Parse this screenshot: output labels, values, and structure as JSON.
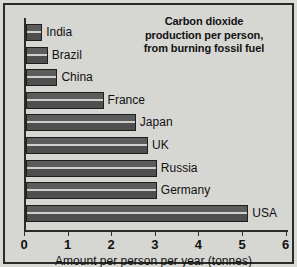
{
  "chart_data": {
    "type": "bar",
    "orientation": "horizontal",
    "title": "Carbon dioxide production per person, from burning fossil fuel",
    "title_lines": [
      "Carbon dioxide",
      "production per person,",
      "from burning fossil fuel"
    ],
    "xlabel": "Amount per person per year (tonnes)",
    "ylabel": "",
    "xlim": [
      0,
      6
    ],
    "xticks": [
      0,
      1,
      2,
      3,
      4,
      5,
      6
    ],
    "xtick_labels": [
      "0",
      "1",
      "2",
      "3",
      "4",
      "5",
      "6"
    ],
    "grid": false,
    "legend": false,
    "categories": [
      "India",
      "Brazil",
      "China",
      "France",
      "Japan",
      "UK",
      "Russia",
      "Germany",
      "USA"
    ],
    "values": [
      0.37,
      0.5,
      0.72,
      1.78,
      2.52,
      2.8,
      3.0,
      3.0,
      5.1
    ],
    "bar_color": "#565656",
    "bar_edge_color": "#1e1e1e",
    "background_color": "#d6d6d2",
    "text_color": "#111111"
  }
}
